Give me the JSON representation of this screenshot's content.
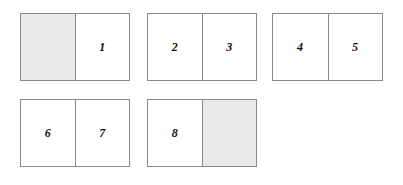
{
  "figure": {
    "background_color": "#ffffff",
    "border_color": "#8a8a8a",
    "shade_color": "#ebeaea",
    "label_color": "#111111",
    "width": 403,
    "height": 185
  },
  "groups": [
    {
      "id": "group-1",
      "x": 20,
      "y": 13,
      "width": 110,
      "height": 68,
      "cells": [
        {
          "label": "",
          "shaded": true
        },
        {
          "label": "1",
          "shaded": false
        }
      ]
    },
    {
      "id": "group-2",
      "x": 147,
      "y": 13,
      "width": 110,
      "height": 68,
      "cells": [
        {
          "label": "2",
          "shaded": false
        },
        {
          "label": "3",
          "shaded": false
        }
      ]
    },
    {
      "id": "group-3",
      "x": 272,
      "y": 13,
      "width": 111,
      "height": 68,
      "cells": [
        {
          "label": "4",
          "shaded": false
        },
        {
          "label": "5",
          "shaded": false
        }
      ]
    },
    {
      "id": "group-4",
      "x": 20,
      "y": 99,
      "width": 110,
      "height": 68,
      "cells": [
        {
          "label": "6",
          "shaded": false
        },
        {
          "label": "7",
          "shaded": false
        }
      ]
    },
    {
      "id": "group-5",
      "x": 147,
      "y": 99,
      "width": 110,
      "height": 68,
      "cells": [
        {
          "label": "8",
          "shaded": false
        },
        {
          "label": "",
          "shaded": true
        }
      ]
    }
  ]
}
